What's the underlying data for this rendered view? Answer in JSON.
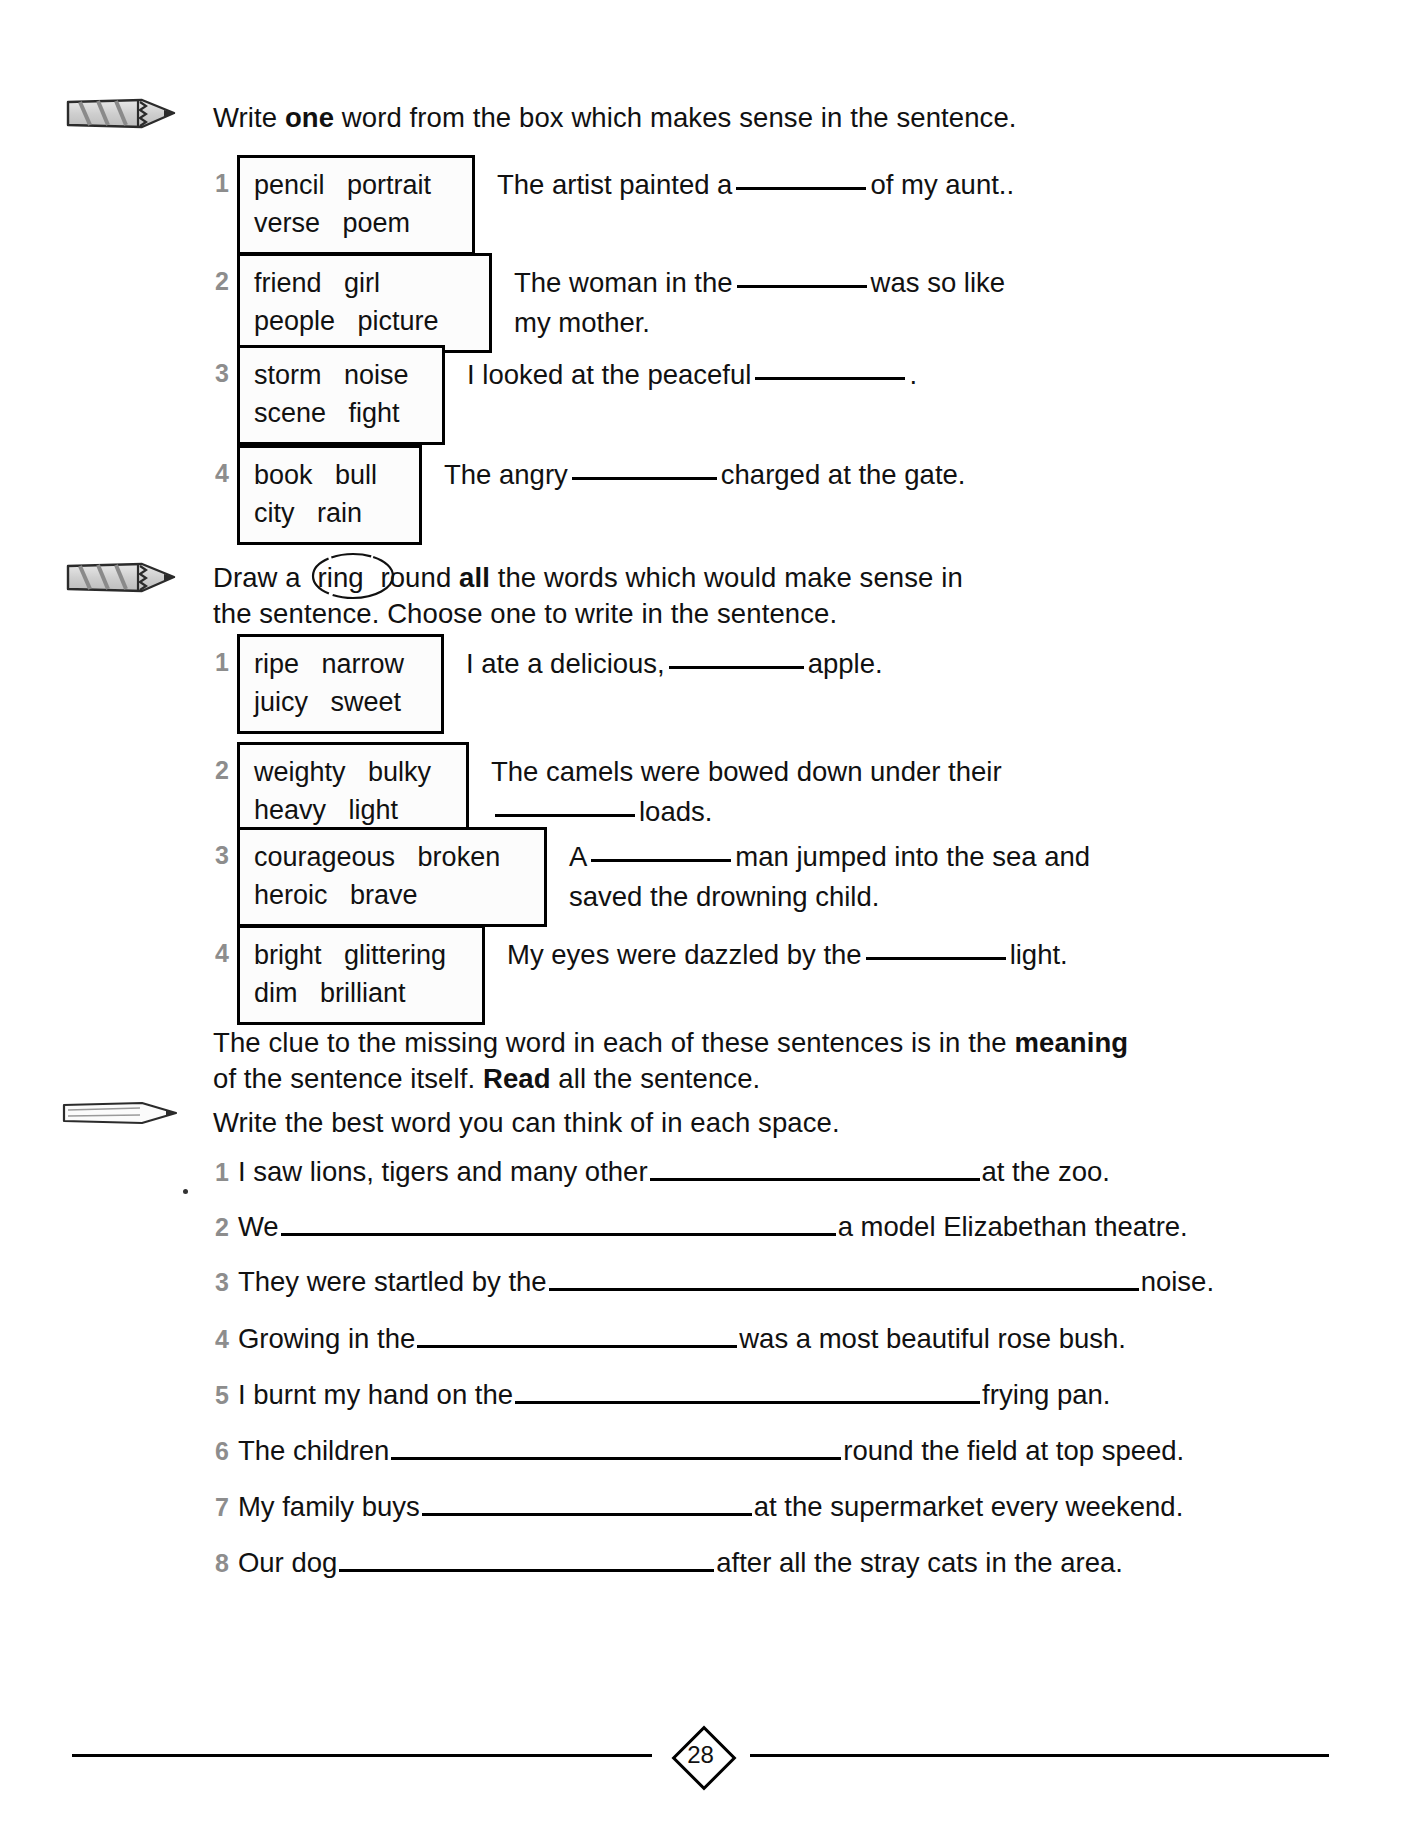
{
  "page": {
    "number": "28"
  },
  "section1": {
    "icon": "pencil-icon",
    "instruction_before": "Write ",
    "instruction_bold": "one",
    "instruction_after": " word from the box which makes sense in the sentence.",
    "items": [
      {
        "number": "1",
        "words_line1": "pencil   portrait",
        "words_line2": "verse   poem",
        "sentence_part1": "The artist painted a",
        "sentence_part2": "of my aunt..",
        "blank_width": 130
      },
      {
        "number": "2",
        "words_line1": "friend   girl",
        "words_line2": "people   picture",
        "sentence_part1": "The woman in the",
        "sentence_part2": "was so like",
        "sentence_line2": "my mother.",
        "blank_width": 130
      },
      {
        "number": "3",
        "words_line1": "storm   noise",
        "words_line2": "scene   fight",
        "sentence_part1": "I looked at the peaceful",
        "sentence_part2": ".",
        "blank_width": 150
      },
      {
        "number": "4",
        "words_line1": "book   bull",
        "words_line2": "city   rain",
        "sentence_part1": "The angry",
        "sentence_part2": "charged at the gate.",
        "blank_width": 145
      }
    ]
  },
  "section2": {
    "icon": "pencil-icon",
    "instruction_part1": "Draw a ",
    "instruction_ring": "ring",
    "instruction_part2": " round ",
    "instruction_bold": "all",
    "instruction_part3": " the words which would make sense in",
    "instruction_line2": "the sentence. Choose one to write in the sentence.",
    "items": [
      {
        "number": "1",
        "words_line1": "ripe   narrow",
        "words_line2": "juicy   sweet",
        "sentence_part1": "I ate a delicious,",
        "sentence_part2": "apple.",
        "blank_width": 135
      },
      {
        "number": "2",
        "words_line1": "weighty   bulky",
        "words_line2": "heavy   light",
        "sentence_part1": "The camels were bowed down under their",
        "sentence_line2_blank": true,
        "sentence_part2": "loads.",
        "blank_width": 140
      },
      {
        "number": "3",
        "words_line1": "courageous   broken",
        "words_line2": "heroic   brave",
        "sentence_part1": "A",
        "sentence_part2": "man jumped into the sea and",
        "sentence_line2": "saved the drowning child.",
        "blank_width": 140
      },
      {
        "number": "4",
        "words_line1": "bright   glittering",
        "words_line2": "dim   brilliant",
        "sentence_part1": "My eyes were dazzled by the",
        "sentence_part2": "light.",
        "blank_width": 140
      }
    ]
  },
  "note": {
    "line1_part1": "The clue to the missing word in each of these sentences is in the ",
    "line1_bold": "meaning",
    "line2_part1": "of the sentence itself. ",
    "line2_bold": "Read",
    "line2_part2": " all the sentence."
  },
  "section3": {
    "icon": "pencil-icon",
    "instruction": "Write the best word you can think of in each space.",
    "items": [
      {
        "number": "1",
        "before": "I saw lions, tigers and many other",
        "after": "at the zoo.",
        "rule_width": 330
      },
      {
        "number": "2",
        "before": "We",
        "after": "a model Elizabethan theatre.",
        "rule_width": 555
      },
      {
        "number": "3",
        "before": "They were startled by the",
        "after": "noise.",
        "rule_width": 590
      },
      {
        "number": "4",
        "before": "Growing in the",
        "after": "was a most beautiful rose bush.",
        "rule_width": 320
      },
      {
        "number": "5",
        "before": "I burnt my hand on the",
        "after": "frying pan.",
        "rule_width": 465
      },
      {
        "number": "6",
        "before": "The children",
        "after": "round the field at top speed.",
        "rule_width": 450
      },
      {
        "number": "7",
        "before": "My family buys",
        "after": "at the supermarket every weekend.",
        "rule_width": 330
      },
      {
        "number": "8",
        "before": "Our dog",
        "after": "after all the stray cats in the area.",
        "rule_width": 375
      }
    ]
  }
}
